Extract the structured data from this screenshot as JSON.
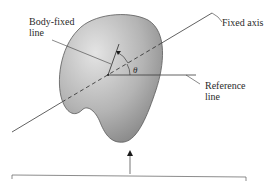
{
  "diagram": {
    "labels": {
      "body_fixed_line": [
        "Body-fixed",
        "line"
      ],
      "fixed_axis": "Fixed axis",
      "reference_line": [
        "Reference",
        "line"
      ],
      "angle": "θ"
    },
    "colors": {
      "line": "#3a3a3a",
      "body_fill_light": "#d9d9d9",
      "body_fill_dark": "#8a8a8a",
      "body_stroke": "#5a5a5a",
      "text": "#2a2a2a"
    }
  }
}
